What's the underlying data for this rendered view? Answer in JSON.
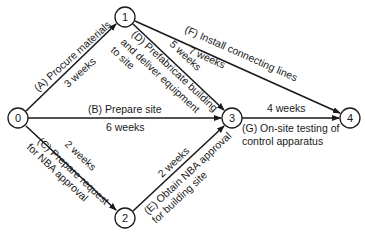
{
  "diagram": {
    "type": "activity-on-arrow network",
    "nodes": [
      {
        "id": "0",
        "label": "0",
        "x": 18,
        "y": 118
      },
      {
        "id": "1",
        "label": "1",
        "x": 125,
        "y": 17
      },
      {
        "id": "2",
        "label": "2",
        "x": 125,
        "y": 218
      },
      {
        "id": "3",
        "label": "3",
        "x": 232,
        "y": 118
      },
      {
        "id": "4",
        "label": "4",
        "x": 350,
        "y": 118
      }
    ],
    "activities": {
      "A": {
        "from": "0",
        "to": "1",
        "name": "(A) Procure materials",
        "duration": "3 weeks"
      },
      "B": {
        "from": "0",
        "to": "3",
        "name": "(B) Prepare site",
        "duration": "6 weeks"
      },
      "C": {
        "from": "0",
        "to": "2",
        "name_line1": "(C) Prepare request",
        "name_line2": "for NBA approval",
        "duration": "2 weeks"
      },
      "D": {
        "from": "1",
        "to": "3",
        "name_line1": "(D) Prefabricate building",
        "name_line2": "and deliver equipment",
        "name_line3": "to site",
        "duration": "5 weeks"
      },
      "E": {
        "from": "2",
        "to": "3",
        "name_line1": "(E) Obtain NBA approval",
        "name_line2": "for building site",
        "duration": "2 weeks"
      },
      "F": {
        "from": "1",
        "to": "4",
        "name": "(F) Install connecting lines",
        "duration": "7 weeks"
      },
      "G": {
        "from": "3",
        "to": "4",
        "name_line1": "(G) On-site testing of",
        "name_line2": "control apparatus",
        "duration": "4 weeks"
      }
    }
  }
}
